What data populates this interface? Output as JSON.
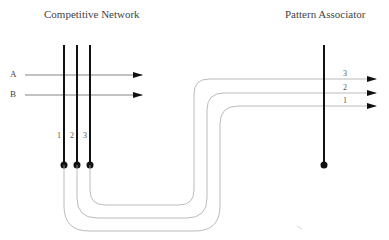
{
  "titles": {
    "left": "Competitive Network",
    "right": "Pattern Associator"
  },
  "inputs": [
    {
      "label": "A"
    },
    {
      "label": "B"
    }
  ],
  "competitive_units": [
    {
      "label": "1"
    },
    {
      "label": "2"
    },
    {
      "label": "3"
    }
  ],
  "associator_inputs": [
    {
      "label": "3"
    },
    {
      "label": "2"
    },
    {
      "label": "1"
    }
  ],
  "colors": {
    "neuron": "#111111",
    "axon": "#bbbbbb",
    "arrow": "#555555"
  }
}
